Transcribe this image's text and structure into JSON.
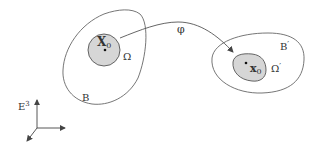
{
  "diagram": {
    "reference_body": {
      "label": "B",
      "region_label": "Ω",
      "point_label": "X",
      "point_subscript": "0"
    },
    "current_body": {
      "label": "B",
      "label_prime": "′",
      "region_label": "Ω",
      "region_prime": "′",
      "point_label": "x",
      "point_subscript": "0"
    },
    "mapping": {
      "label": "φ"
    },
    "frame": {
      "label": "E",
      "superscript": "3"
    },
    "colors": {
      "stroke": "#555555",
      "fill": "#d6d6d6",
      "text": "#333333",
      "background": "#ffffff"
    }
  }
}
